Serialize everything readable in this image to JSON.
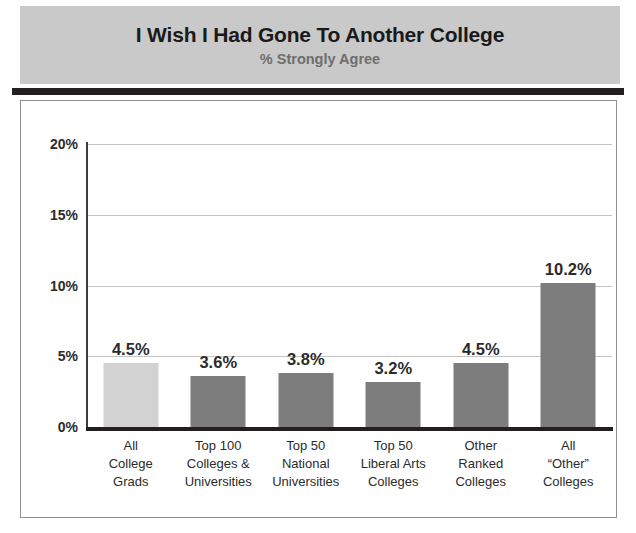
{
  "header": {
    "title": "I Wish I Had Gone To Another College",
    "subtitle": "% Strongly Agree"
  },
  "colors": {
    "header_band": "#c9c9c9",
    "header_rule": "#231f20",
    "bar_highlight": "#d2d2d2",
    "bar_default": "#7d7d7d",
    "gridline": "#c4c4c4",
    "axis": "#231f20",
    "title_text": "#1a1a1a",
    "subtitle_text": "#6e6e6e",
    "frame_border": "#8f8f8f"
  },
  "chart_data": {
    "type": "bar",
    "title": "I Wish I Had Gone To Another College",
    "subtitle": "% Strongly Agree",
    "xlabel": "",
    "ylabel": "",
    "ylim": [
      0,
      20
    ],
    "yticks": [
      0,
      5,
      10,
      15,
      20
    ],
    "ytick_labels": [
      "0%",
      "5%",
      "10%",
      "15%",
      "20%"
    ],
    "grid": true,
    "legend": false,
    "categories": [
      "All College Grads",
      "Top 100 Colleges & Universities",
      "Top 50 National Universities",
      "Top 50 Liberal Arts Colleges",
      "Other Ranked Colleges",
      "All “Other” Colleges"
    ],
    "category_lines": [
      [
        "All",
        "College",
        "Grads"
      ],
      [
        "Top 100",
        "Colleges &",
        "Universities"
      ],
      [
        "Top 50",
        "National",
        "Universities"
      ],
      [
        "Top 50",
        "Liberal Arts",
        "Colleges"
      ],
      [
        "Other",
        "Ranked",
        "Colleges"
      ],
      [
        "All",
        "“Other”",
        "Colleges"
      ]
    ],
    "values": [
      4.5,
      3.6,
      3.8,
      3.2,
      4.5,
      10.2
    ],
    "value_labels": [
      "4.5%",
      "3.6%",
      "3.8%",
      "3.2%",
      "4.5%",
      "10.2%"
    ],
    "bar_colors": [
      "#d2d2d2",
      "#7d7d7d",
      "#7d7d7d",
      "#7d7d7d",
      "#7d7d7d",
      "#7d7d7d"
    ]
  }
}
